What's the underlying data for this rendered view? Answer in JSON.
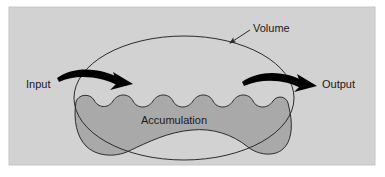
{
  "figure": {
    "type": "conceptual-flow-diagram",
    "canvas": {
      "width": 385,
      "height": 177
    },
    "colors": {
      "page_background": "#ffffff",
      "panel_background": "#d2d2d2",
      "panel_border": "#c2c2c2",
      "accumulation_fill": "#a9a9a9",
      "outline_stroke": "#2b2b2b",
      "arrow_color": "#000000",
      "label_color": "#1a1a1a",
      "leader_line_color": "#2b2b2b"
    },
    "panel": {
      "x": 9,
      "y": 7,
      "width": 366,
      "height": 158
    }
  },
  "labels": {
    "volume": {
      "text": "Volume",
      "x": 253,
      "y": 32,
      "anchor": "start",
      "font_size": 11,
      "role": "callout-label-for-volume-boundary"
    },
    "input": {
      "text": "Input",
      "x": 26,
      "y": 88,
      "anchor": "start",
      "font_size": 11,
      "role": "flow-in-label"
    },
    "output": {
      "text": "Output",
      "x": 322,
      "y": 88,
      "anchor": "start",
      "font_size": 11,
      "role": "flow-out-label"
    },
    "accumulation": {
      "text": "Accumulation",
      "x": 174,
      "y": 124,
      "anchor": "middle",
      "font_size": 11,
      "role": "region-label-for-accumulation-area"
    }
  },
  "shapes": {
    "volume_boundary": {
      "name": "volume-boundary",
      "description": "Large thin ellipse-like outline enclosing the control volume",
      "cx": 184,
      "cy": 98,
      "rx": 110,
      "ry": 62,
      "stroke": "#2b2b2b",
      "stroke_width": 1,
      "fill": "none"
    },
    "accumulation_region": {
      "name": "accumulation-region",
      "description": "Shaded blob with wavy top surface representing accumulated material",
      "fill": "#a9a9a9",
      "stroke": "#2b2b2b",
      "stroke_width": 1,
      "wave_crest_count": 5,
      "surface_y": 100,
      "bottom_y": 153
    },
    "volume_leader_line": {
      "name": "volume-leader-line",
      "from": {
        "x": 250,
        "y": 31
      },
      "to": {
        "x": 228,
        "y": 45
      },
      "has_arrowhead": true
    },
    "input_arrow": {
      "name": "input-arrow",
      "description": "Thick curved arrow entering the volume from the left, pointing right",
      "start": {
        "x": 58,
        "y": 78
      },
      "end": {
        "x": 130,
        "y": 85
      },
      "direction": "rightward-into-volume"
    },
    "output_arrow": {
      "name": "output-arrow",
      "description": "Thick curved arrow exiting the volume to the right, pointing right-down",
      "start": {
        "x": 243,
        "y": 81
      },
      "end": {
        "x": 315,
        "y": 86
      },
      "direction": "rightward-out-of-volume"
    }
  }
}
